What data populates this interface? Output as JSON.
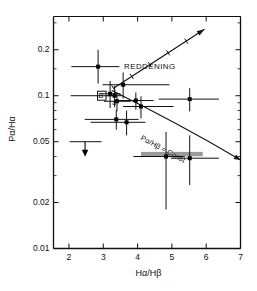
{
  "chart_data": {
    "type": "scatter",
    "title": "",
    "xlabel": "Hα/Hβ",
    "ylabel": "Pα/Hα",
    "xlim": [
      1.55,
      7.0
    ],
    "ylim": [
      0.01,
      0.33
    ],
    "yscale": "log",
    "xscale": "linear",
    "grid": false,
    "legend": "none",
    "xticks": [
      2,
      3,
      4,
      5,
      6,
      7
    ],
    "xticklabels": [
      "2",
      "3",
      "4",
      "5",
      "6",
      "7"
    ],
    "yticks": [
      0.2,
      0.1,
      0.05,
      0.02,
      0.01
    ],
    "yticklabels": [
      "0.2",
      "0.1",
      "0.05",
      "0.02",
      "0.01"
    ],
    "points": [
      {
        "x": 2.85,
        "y": 0.155,
        "xerr_lo": 0.78,
        "xerr_hi": 0.62,
        "yerr_lo": 0.035,
        "yerr_hi": 0.045
      },
      {
        "x": 3.2,
        "y": 0.103,
        "xerr_lo": 0.3,
        "xerr_hi": 0.3,
        "yerr_lo": 0.02,
        "yerr_hi": 0.022
      },
      {
        "x": 3.33,
        "y": 0.1,
        "xerr_lo": 0.22,
        "xerr_hi": 0.2,
        "yerr_lo": 0.016,
        "yerr_hi": 0.016
      },
      {
        "x": 3.58,
        "y": 0.118,
        "xerr_lo": 0.6,
        "xerr_hi": 1.35,
        "yerr_lo": 0.022,
        "yerr_hi": 0.024
      },
      {
        "x": 3.4,
        "y": 0.092,
        "xerr_lo": 0.38,
        "xerr_hi": 0.4,
        "yerr_lo": 0.013,
        "yerr_hi": 0.013
      },
      {
        "x": 3.95,
        "y": 0.093,
        "xerr_lo": 0.55,
        "xerr_hi": 0.52,
        "yerr_lo": 0.012,
        "yerr_hi": 0.012
      },
      {
        "x": 4.1,
        "y": 0.085,
        "xerr_lo": 0.52,
        "xerr_hi": 0.95,
        "yerr_lo": 0.014,
        "yerr_hi": 0.014
      },
      {
        "x": 3.38,
        "y": 0.07,
        "xerr_lo": 0.92,
        "xerr_hi": 0.65,
        "yerr_lo": 0.01,
        "yerr_hi": 0.011
      },
      {
        "x": 3.68,
        "y": 0.067,
        "xerr_lo": 1.05,
        "xerr_hi": 0.55,
        "yerr_lo": 0.012,
        "yerr_hi": 0.013
      },
      {
        "x": 5.52,
        "y": 0.095,
        "xerr_lo": 0.9,
        "xerr_hi": 0.85,
        "yerr_lo": 0.016,
        "yerr_hi": 0.017
      },
      {
        "x": 4.83,
        "y": 0.04,
        "xerr_lo": 0.95,
        "xerr_hi": 0.55,
        "yerr_lo": 0.022,
        "yerr_hi": 0.018
      },
      {
        "x": 5.52,
        "y": 0.039,
        "xerr_lo": 0.55,
        "xerr_hi": 0.85,
        "yerr_lo": 0.013,
        "yerr_hi": 0.016
      }
    ],
    "upper_limits": [
      {
        "x": 2.47,
        "y": 0.05,
        "xerr_lo": 0.45,
        "xerr_hi": 0.48,
        "arrow": "down"
      }
    ],
    "shaded_bars": [
      {
        "y": 0.0415,
        "x_start": 4.1,
        "x_end": 5.9,
        "color": "#888888"
      }
    ],
    "reddening_vector": {
      "label": "REDDENING",
      "x_start": 3.3,
      "y_start": 0.112,
      "x_end": 5.95,
      "y_end": 0.272,
      "tick_count": 4
    },
    "const_line": {
      "label": "Pα/Hβ = Const",
      "x_start": 3.25,
      "y_start": 0.108,
      "x_end": 7.0,
      "y_end": 0.038
    },
    "markers": [
      {
        "label": "B",
        "x": 2.95,
        "y": 0.1,
        "type": "box-label"
      },
      {
        "label": "a",
        "x": 3.32,
        "y": 0.091,
        "type": "small-label"
      }
    ],
    "hlines": [
      {
        "y": 0.1,
        "x_start": 2.05,
        "x_end": 3.3
      }
    ],
    "colors": {
      "axis": "#111111",
      "marker": "#000000",
      "errorbar": "#111111",
      "shaded": "#888888",
      "background": "#ffffff"
    }
  }
}
